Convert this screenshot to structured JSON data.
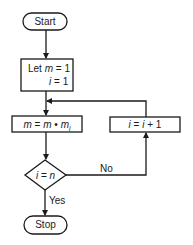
{
  "flowchart": {
    "start": {
      "label": "Start"
    },
    "init": {
      "line1_prefix": "Let ",
      "line1_var": "m",
      "line1_rest": " = 1",
      "line2_var": "i",
      "line2_rest": " = 1"
    },
    "multiply": {
      "var1": "m",
      "eq": " = ",
      "var2": "m",
      "dot": " • ",
      "var3": "m",
      "sub": "i"
    },
    "decision": {
      "var1": "i",
      "eq": " = ",
      "var2": "n"
    },
    "increment": {
      "var1": "i",
      "eq": " = ",
      "var2": "i",
      "rest": " + 1"
    },
    "no_label": "No",
    "yes_label": "Yes",
    "stop": {
      "label": "Stop"
    }
  },
  "colors": {
    "stroke": "#1a1a1a",
    "background": "#ffffff"
  }
}
